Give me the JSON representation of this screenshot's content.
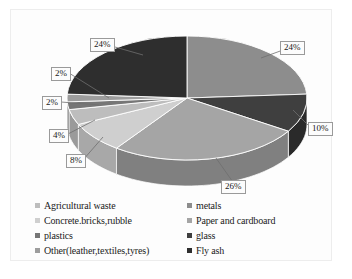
{
  "chart_data": {
    "type": "pie",
    "title": "",
    "subtitle": "",
    "xlabel": "",
    "ylabel": "",
    "legend_position": "bottom",
    "grid": false,
    "three_d": true,
    "categories": [
      "metals",
      "Paper and cardboard",
      "glass",
      "Concrete.bricks,rubble",
      "Agricultural waste",
      "plastics",
      "Other(leather,textiles,tyres)",
      "Fly ash"
    ],
    "values": [
      24,
      10,
      26,
      8,
      4,
      2,
      2,
      24
    ],
    "data_labels": [
      "24%",
      "10%",
      "26%",
      "8%",
      "4%",
      "2%",
      "2%",
      "24%"
    ],
    "colors": [
      "#8d8d8d",
      "#3f3f3f",
      "#a5a5a5",
      "#cfcfcf",
      "#bdbdbd",
      "#767676",
      "#9d9d9d",
      "#2e2e2e"
    ],
    "side_colors": [
      "#6f6f6f",
      "#2a2a2a",
      "#808080",
      "#a8a8a8",
      "#9a9a9a",
      "#5a5a5a",
      "#7b7b7b",
      "#1f1f1f"
    ],
    "total": 100,
    "units": "%"
  },
  "labels": {
    "top_left": "24%",
    "top_right": "24%",
    "right": "10%",
    "bottom": "26%",
    "left_8": "8%",
    "left_4": "4%",
    "left_2a": "2%",
    "left_2b": "2%"
  },
  "legend": {
    "left_column": [
      {
        "label": "Agricultural waste",
        "color": "#bdbdbd"
      },
      {
        "label": "Concrete.bricks,rubble",
        "color": "#cfcfcf"
      },
      {
        "label": "plastics",
        "color": "#767676"
      },
      {
        "label": "Other(leather,textiles,tyres)",
        "color": "#9d9d9d"
      }
    ],
    "right_column": [
      {
        "label": "metals",
        "color": "#8d8d8d"
      },
      {
        "label": "Paper and cardboard",
        "color": "#a5a5a5"
      },
      {
        "label": "glass",
        "color": "#3f3f3f"
      },
      {
        "label": "Fly ash",
        "color": "#2e2e2e"
      }
    ]
  }
}
